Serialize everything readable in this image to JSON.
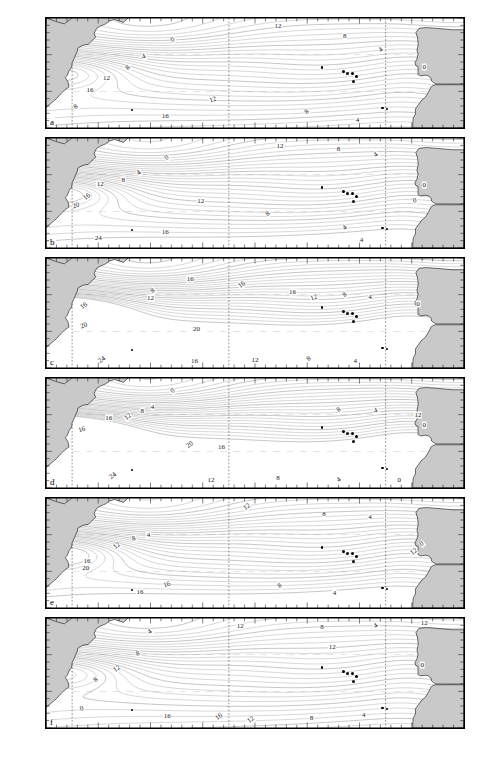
{
  "figure": {
    "type": "multi-panel-contour-map",
    "region": "North Atlantic Ocean",
    "panel_count": 6,
    "colors": {
      "land": "#c9c9c9",
      "ocean": "#ffffff",
      "coastline": "#000000",
      "contour": "#4a4a4a",
      "graticule": "#9a9a9a",
      "text": "#111111"
    }
  },
  "axes": {
    "y_title": "",
    "x_title": "",
    "y_ticks": [
      "45°",
      "40°",
      "35°",
      "30°"
    ],
    "y_hemisphere": "N",
    "y_range": [
      30,
      45
    ],
    "x_ticks": [
      "80°",
      "70°",
      "60°",
      "50°",
      "40°",
      "30°",
      "20°",
      "10° W",
      "0°"
    ],
    "x_range": [
      -80,
      0
    ],
    "x_tick_values": [
      -80,
      -70,
      -60,
      -50,
      -40,
      -30,
      -20,
      -10,
      0
    ]
  },
  "panels": [
    {
      "id": "a",
      "label": "a",
      "y_ticks": [
        "45°",
        "40°",
        "35°"
      ],
      "contour_labels": [
        {
          "text": "0",
          "x": 0.305,
          "y": 0.2
        },
        {
          "text": "12",
          "x": 0.555,
          "y": 0.075
        },
        {
          "text": "8",
          "x": 0.715,
          "y": 0.165
        },
        {
          "text": "4",
          "x": 0.802,
          "y": 0.295
        },
        {
          "text": "0",
          "x": 0.905,
          "y": 0.445
        },
        {
          "text": "4",
          "x": 0.235,
          "y": 0.355
        },
        {
          "text": "8",
          "x": 0.195,
          "y": 0.455
        },
        {
          "text": "12",
          "x": 0.145,
          "y": 0.545
        },
        {
          "text": "16",
          "x": 0.105,
          "y": 0.655
        },
        {
          "text": "8",
          "x": 0.072,
          "y": 0.805
        },
        {
          "text": "12",
          "x": 0.4,
          "y": 0.745
        },
        {
          "text": "16",
          "x": 0.285,
          "y": 0.89
        },
        {
          "text": "8",
          "x": 0.625,
          "y": 0.855
        },
        {
          "text": "4",
          "x": 0.745,
          "y": 0.93
        }
      ]
    },
    {
      "id": "b",
      "label": "b",
      "y_ticks": [
        "45°",
        "40°",
        "35°"
      ],
      "contour_labels": [
        {
          "text": "0",
          "x": 0.29,
          "y": 0.185
        },
        {
          "text": "12",
          "x": 0.56,
          "y": 0.07
        },
        {
          "text": "8",
          "x": 0.7,
          "y": 0.1
        },
        {
          "text": "4",
          "x": 0.79,
          "y": 0.155
        },
        {
          "text": "0",
          "x": 0.905,
          "y": 0.43
        },
        {
          "text": "0",
          "x": 0.882,
          "y": 0.57
        },
        {
          "text": "4",
          "x": 0.222,
          "y": 0.32
        },
        {
          "text": "8",
          "x": 0.185,
          "y": 0.385
        },
        {
          "text": "12",
          "x": 0.13,
          "y": 0.415
        },
        {
          "text": "16",
          "x": 0.098,
          "y": 0.54
        },
        {
          "text": "20",
          "x": 0.072,
          "y": 0.62
        },
        {
          "text": "12",
          "x": 0.37,
          "y": 0.575
        },
        {
          "text": "8",
          "x": 0.53,
          "y": 0.69
        },
        {
          "text": "16",
          "x": 0.285,
          "y": 0.855
        },
        {
          "text": "24",
          "x": 0.125,
          "y": 0.905
        },
        {
          "text": "4",
          "x": 0.715,
          "y": 0.82
        },
        {
          "text": "4",
          "x": 0.755,
          "y": 0.93
        }
      ]
    },
    {
      "id": "c",
      "label": "c",
      "y_ticks": [
        "45°",
        "40°",
        "35°"
      ],
      "contour_labels": [
        {
          "text": "8",
          "x": 0.255,
          "y": 0.3
        },
        {
          "text": "12",
          "x": 0.25,
          "y": 0.365
        },
        {
          "text": "16",
          "x": 0.345,
          "y": 0.195
        },
        {
          "text": "16",
          "x": 0.468,
          "y": 0.245
        },
        {
          "text": "16",
          "x": 0.59,
          "y": 0.305
        },
        {
          "text": "12",
          "x": 0.64,
          "y": 0.36
        },
        {
          "text": "8",
          "x": 0.715,
          "y": 0.34
        },
        {
          "text": "4",
          "x": 0.775,
          "y": 0.355
        },
        {
          "text": "0",
          "x": 0.89,
          "y": 0.42
        },
        {
          "text": "16",
          "x": 0.092,
          "y": 0.44
        },
        {
          "text": "20",
          "x": 0.09,
          "y": 0.62
        },
        {
          "text": "20",
          "x": 0.36,
          "y": 0.645
        },
        {
          "text": "24",
          "x": 0.135,
          "y": 0.93
        },
        {
          "text": "16",
          "x": 0.355,
          "y": 0.935
        },
        {
          "text": "12",
          "x": 0.5,
          "y": 0.93
        },
        {
          "text": "8",
          "x": 0.63,
          "y": 0.92
        },
        {
          "text": "4",
          "x": 0.74,
          "y": 0.935
        }
      ]
    },
    {
      "id": "d",
      "label": "d",
      "y_ticks": [
        "45°",
        "40°",
        "35°"
      ],
      "contour_labels": [
        {
          "text": "0",
          "x": 0.305,
          "y": 0.12
        },
        {
          "text": "4",
          "x": 0.255,
          "y": 0.265
        },
        {
          "text": "8",
          "x": 0.23,
          "y": 0.3
        },
        {
          "text": "12",
          "x": 0.195,
          "y": 0.355
        },
        {
          "text": "16",
          "x": 0.15,
          "y": 0.365
        },
        {
          "text": "16",
          "x": 0.085,
          "y": 0.47
        },
        {
          "text": "20",
          "x": 0.345,
          "y": 0.61
        },
        {
          "text": "16",
          "x": 0.42,
          "y": 0.625
        },
        {
          "text": "12",
          "x": 0.89,
          "y": 0.34
        },
        {
          "text": "8",
          "x": 0.7,
          "y": 0.29
        },
        {
          "text": "4",
          "x": 0.79,
          "y": 0.3
        },
        {
          "text": "0",
          "x": 0.905,
          "y": 0.425
        },
        {
          "text": "24",
          "x": 0.16,
          "y": 0.89
        },
        {
          "text": "12",
          "x": 0.395,
          "y": 0.925
        },
        {
          "text": "8",
          "x": 0.555,
          "y": 0.905
        },
        {
          "text": "4",
          "x": 0.7,
          "y": 0.93
        },
        {
          "text": "0",
          "x": 0.845,
          "y": 0.925
        }
      ]
    },
    {
      "id": "e",
      "label": "e",
      "y_ticks": [
        "45°",
        "40°",
        "35°"
      ],
      "contour_labels": [
        {
          "text": "12",
          "x": 0.48,
          "y": 0.08
        },
        {
          "text": "8",
          "x": 0.665,
          "y": 0.145
        },
        {
          "text": "4",
          "x": 0.775,
          "y": 0.175
        },
        {
          "text": "0",
          "x": 0.9,
          "y": 0.415
        },
        {
          "text": "4",
          "x": 0.245,
          "y": 0.34
        },
        {
          "text": "8",
          "x": 0.21,
          "y": 0.375
        },
        {
          "text": "12",
          "x": 0.17,
          "y": 0.44
        },
        {
          "text": "16",
          "x": 0.098,
          "y": 0.575
        },
        {
          "text": "20",
          "x": 0.095,
          "y": 0.64
        },
        {
          "text": "12",
          "x": 0.88,
          "y": 0.49
        },
        {
          "text": "16",
          "x": 0.29,
          "y": 0.79
        },
        {
          "text": "16",
          "x": 0.225,
          "y": 0.855
        },
        {
          "text": "8",
          "x": 0.56,
          "y": 0.8
        },
        {
          "text": "4",
          "x": 0.69,
          "y": 0.865
        }
      ]
    },
    {
      "id": "f",
      "label": "f",
      "y_ticks": [
        "45°",
        "40°",
        "35°",
        "30°"
      ],
      "contour_labels": [
        {
          "text": "4",
          "x": 0.248,
          "y": 0.125
        },
        {
          "text": "12",
          "x": 0.465,
          "y": 0.075
        },
        {
          "text": "8",
          "x": 0.66,
          "y": 0.085
        },
        {
          "text": "4",
          "x": 0.79,
          "y": 0.075
        },
        {
          "text": "12",
          "x": 0.905,
          "y": 0.045
        },
        {
          "text": "8",
          "x": 0.22,
          "y": 0.325
        },
        {
          "text": "12",
          "x": 0.17,
          "y": 0.46
        },
        {
          "text": "12",
          "x": 0.685,
          "y": 0.265
        },
        {
          "text": "0",
          "x": 0.9,
          "y": 0.43
        },
        {
          "text": "8",
          "x": 0.12,
          "y": 0.565
        },
        {
          "text": "0",
          "x": 0.085,
          "y": 0.83
        },
        {
          "text": "16",
          "x": 0.29,
          "y": 0.895
        },
        {
          "text": "12",
          "x": 0.49,
          "y": 0.925
        },
        {
          "text": "8",
          "x": 0.635,
          "y": 0.905
        },
        {
          "text": "4",
          "x": 0.76,
          "y": 0.88
        },
        {
          "text": "16",
          "x": 0.415,
          "y": 0.9
        }
      ]
    }
  ],
  "markers": {
    "name": "station-dots",
    "description": "Azores archipelago and isolated island/station points",
    "points": [
      {
        "x": 0.66,
        "y": 0.45
      },
      {
        "x": 0.712,
        "y": 0.49
      },
      {
        "x": 0.722,
        "y": 0.505
      },
      {
        "x": 0.733,
        "y": 0.5
      },
      {
        "x": 0.742,
        "y": 0.53
      },
      {
        "x": 0.735,
        "y": 0.58
      },
      {
        "x": 0.205,
        "y": 0.84
      },
      {
        "x": 0.805,
        "y": 0.815
      },
      {
        "x": 0.815,
        "y": 0.828
      }
    ]
  }
}
